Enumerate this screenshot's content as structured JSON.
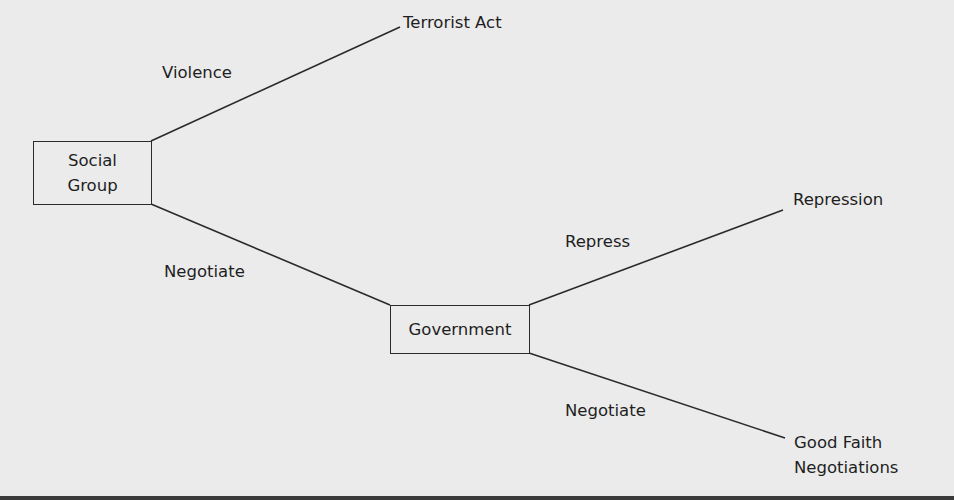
{
  "diagram": {
    "type": "decision-tree",
    "colors": {
      "background": "#ebebeb",
      "stroke": "#2a2a2a",
      "text": "#1e1e1e"
    },
    "nodes": {
      "social_group": {
        "line1": "Social",
        "line2": "Group"
      },
      "government": {
        "label": "Government"
      }
    },
    "outcomes": {
      "terrorist_act": "Terrorist Act",
      "repression": "Repression",
      "good_faith_line1": "Good Faith",
      "good_faith_line2": "Negotiations"
    },
    "edges": {
      "violence": "Violence",
      "negotiate_1": "Negotiate",
      "repress": "Repress",
      "negotiate_2": "Negotiate"
    }
  }
}
